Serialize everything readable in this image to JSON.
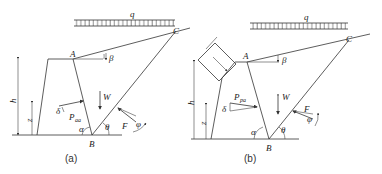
{
  "figures": [
    {
      "id": "a",
      "caption": "(a)",
      "labels": {
        "load": "q",
        "point_A": "A",
        "point_B": "B",
        "point_C": "C",
        "angle_beta": "β",
        "height": "h",
        "z": "z",
        "weight": "W",
        "earth_pressure": "P",
        "earth_pressure_sub": "aa",
        "delta": "δ",
        "alpha": "α",
        "theta": "θ",
        "reaction": "F",
        "phi": "φ"
      }
    },
    {
      "id": "b",
      "caption": "(b)",
      "labels": {
        "load": "q",
        "point_A": "A",
        "point_B": "B",
        "point_C": "C",
        "angle_beta": "β",
        "height": "h",
        "z": "z",
        "weight": "W",
        "earth_pressure": "P",
        "earth_pressure_sub": "pa",
        "delta": "δ",
        "alpha": "α",
        "theta": "θ",
        "reaction": "F",
        "phi": "φ"
      }
    }
  ]
}
